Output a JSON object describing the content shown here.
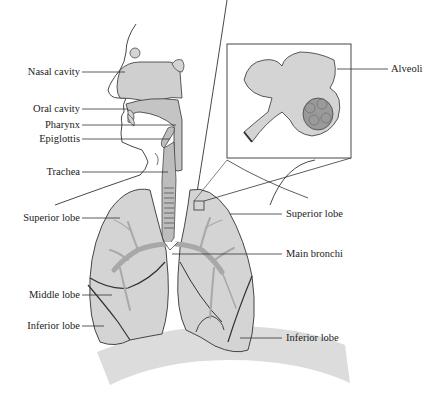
{
  "diagram": {
    "colors": {
      "organ_fill": "#d4d4d4",
      "airway_fill": "#bdbdbd",
      "bronchi_fill": "#a8a8a8",
      "alveoli_dark": "#9a9a9a",
      "diaphragm_fill": "#dcdcdc",
      "outline": "#333333"
    },
    "labels_left": [
      {
        "id": "nasal-cavity",
        "text": "Nasal cavity"
      },
      {
        "id": "oral-cavity",
        "text": "Oral cavity"
      },
      {
        "id": "pharynx",
        "text": "Pharynx"
      },
      {
        "id": "epiglottis",
        "text": "Epiglottis"
      },
      {
        "id": "trachea",
        "text": "Trachea"
      },
      {
        "id": "superior-lobe-left",
        "text": "Superior lobe"
      },
      {
        "id": "middle-lobe",
        "text": "Middle lobe"
      },
      {
        "id": "inferior-lobe-left",
        "text": "Inferior lobe"
      }
    ],
    "labels_right": [
      {
        "id": "alveoli",
        "text": "Alveoli"
      },
      {
        "id": "superior-lobe-right",
        "text": "Superior lobe"
      },
      {
        "id": "main-bronchi",
        "text": "Main bronchi"
      },
      {
        "id": "inferior-lobe-right",
        "text": "Inferior lobe"
      }
    ]
  }
}
